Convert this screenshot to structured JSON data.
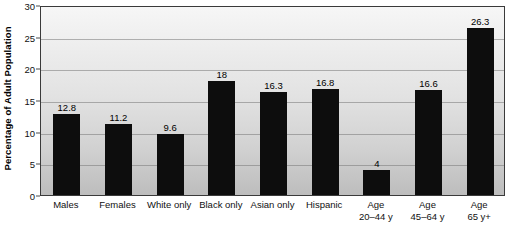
{
  "chart_data": {
    "type": "bar",
    "title": "",
    "xlabel": "",
    "ylabel": "Percentage of Adult Population",
    "ylim": [
      0,
      30
    ],
    "yticks": [
      0,
      5,
      10,
      15,
      20,
      25,
      30
    ],
    "ytick_labels": [
      "0",
      "5",
      "10",
      "15",
      "20",
      "25",
      "30"
    ],
    "grid": true,
    "legend": "none",
    "bar_color": "#0d0d0d",
    "categories": [
      "Males",
      "Females",
      "White only",
      "Black only",
      "Asian only",
      "Hispanic",
      "Age 20–44 y",
      "Age 45–64 y",
      "Age 65 y+"
    ],
    "category_lines": [
      [
        "Males",
        ""
      ],
      [
        "Females",
        ""
      ],
      [
        "White only",
        ""
      ],
      [
        "Black only",
        ""
      ],
      [
        "Asian only",
        ""
      ],
      [
        "Hispanic",
        ""
      ],
      [
        "Age",
        "20–44 y"
      ],
      [
        "Age",
        "45–64 y"
      ],
      [
        "Age",
        "65 y+"
      ]
    ],
    "values": [
      12.8,
      11.2,
      9.6,
      18,
      16.3,
      16.8,
      4,
      16.6,
      26.3
    ],
    "value_labels": [
      "12.8",
      "11.2",
      "9.6",
      "18",
      "16.3",
      "16.8",
      "4",
      "16.6",
      "26.3"
    ]
  },
  "style": {
    "plot_border_color": "#3a3a3a",
    "gridline_color": "#787878",
    "background_top": "#f6f6f6",
    "background_bottom": "#bdbdbd"
  }
}
